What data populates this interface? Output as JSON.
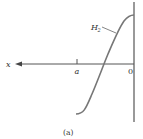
{
  "figure": {
    "caption": "(a)",
    "axis_label_x": "x",
    "tick_label_a": "a",
    "origin_label": "0",
    "curve_label_main": "H",
    "curve_label_sub": "2"
  },
  "colors": {
    "line": "#555555",
    "curve": "#777777",
    "text": "#333333"
  }
}
